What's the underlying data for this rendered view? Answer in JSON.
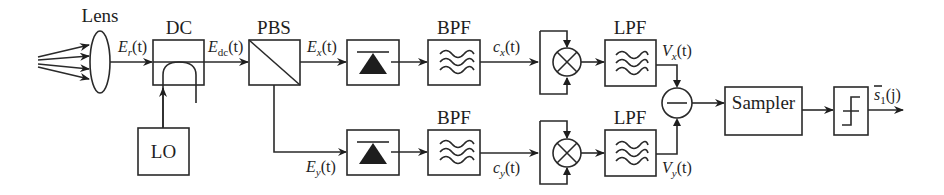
{
  "diagram": {
    "type": "block-diagram",
    "blocks": {
      "lens": {
        "label": "Lens"
      },
      "dc": {
        "label": "DC"
      },
      "lo": {
        "label": "LO"
      },
      "pbs": {
        "label": "PBS"
      },
      "bpf_x": {
        "label": "BPF"
      },
      "bpf_y": {
        "label": "BPF"
      },
      "lpf_x": {
        "label": "LPF"
      },
      "lpf_y": {
        "label": "LPF"
      },
      "sampler": {
        "label": "Sampler"
      }
    },
    "signals": {
      "er": {
        "main": "E",
        "sub": "r",
        "arg": "(t)"
      },
      "edc": {
        "main": "E",
        "sub": "dc",
        "arg": "(t)"
      },
      "ex": {
        "main": "E",
        "sub": "x",
        "arg": "(t)"
      },
      "ey": {
        "main": "E",
        "sub": "y",
        "arg": "(t)"
      },
      "cx": {
        "main": "c",
        "sub": "x",
        "arg": "(t)"
      },
      "cy": {
        "main": "c",
        "sub": "y",
        "arg": "(t)"
      },
      "vx": {
        "main": "V",
        "sub": "x",
        "arg": "(t)"
      },
      "vy": {
        "main": "V",
        "sub": "y",
        "arg": "(t)"
      },
      "s1": {
        "main": "s",
        "sub": "1",
        "arg": "(j)"
      }
    },
    "icons": {
      "photodetector": "photodiode-icon",
      "filter": "filter-wave-icon",
      "mixer": "multiplier-icon",
      "subtractor": "subtractor-icon",
      "decision": "threshold-step-icon"
    }
  }
}
